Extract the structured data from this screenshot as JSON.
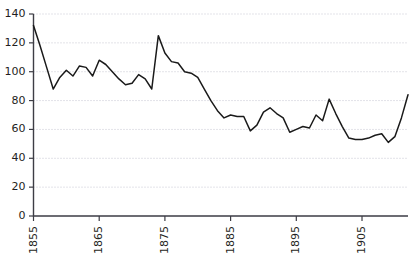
{
  "chart_data": {
    "type": "line",
    "title": "",
    "subtitle": "",
    "xlabel": "",
    "ylabel": "",
    "xlim": [
      1855,
      1912
    ],
    "ylim": [
      0,
      140
    ],
    "grid": true,
    "legend": null,
    "y_ticks": [
      0,
      20,
      40,
      60,
      80,
      100,
      120,
      140
    ],
    "x_ticks": [
      1855,
      1865,
      1875,
      1885,
      1895,
      1905
    ],
    "x_tick_labels": [
      "1855",
      "1865",
      "1875",
      "1885",
      "1895",
      "1905"
    ],
    "y_tick_labels": [
      "0",
      "20",
      "40",
      "60",
      "80",
      "100",
      "120",
      "140"
    ],
    "x_tick_rotation": 90,
    "series": [
      {
        "name": "series-1",
        "color": "#1a1a1a",
        "x": [
          1855,
          1856,
          1857,
          1858,
          1859,
          1860,
          1861,
          1862,
          1863,
          1864,
          1865,
          1866,
          1867,
          1868,
          1869,
          1870,
          1871,
          1872,
          1873,
          1874,
          1875,
          1876,
          1877,
          1878,
          1879,
          1880,
          1881,
          1882,
          1883,
          1884,
          1885,
          1886,
          1887,
          1888,
          1889,
          1890,
          1891,
          1892,
          1893,
          1894,
          1895,
          1896,
          1897,
          1898,
          1899,
          1900,
          1901,
          1902,
          1903,
          1904,
          1905,
          1906,
          1907,
          1908,
          1909,
          1910,
          1911,
          1912
        ],
        "values": [
          132,
          118,
          103,
          88,
          96,
          101,
          97,
          104,
          103,
          97,
          108,
          105,
          100,
          95,
          91,
          92,
          98,
          95,
          88,
          125,
          113,
          107,
          106,
          100,
          99,
          96,
          88,
          80,
          73,
          68,
          70,
          69,
          69,
          59,
          63,
          72,
          75,
          71,
          68,
          58,
          60,
          62,
          61,
          70,
          66,
          81,
          71,
          62,
          54,
          53,
          53,
          54,
          56,
          57,
          51,
          55,
          68,
          84
        ]
      }
    ]
  }
}
